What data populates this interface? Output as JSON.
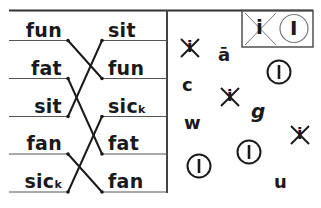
{
  "worksheet": {
    "colors": {
      "ink": "#1a1a1a",
      "rule": "#555555"
    },
    "matching": {
      "left_words": [
        {
          "text": "fun",
          "sub": ""
        },
        {
          "text": "fat",
          "sub": ""
        },
        {
          "text": "sit",
          "sub": ""
        },
        {
          "text": "fan",
          "sub": ""
        },
        {
          "text": "sic",
          "sub": "k"
        }
      ],
      "right_words": [
        {
          "text": "sit",
          "sub": ""
        },
        {
          "text": "fun",
          "sub": ""
        },
        {
          "text": "sic",
          "sub": "k"
        },
        {
          "text": "fat",
          "sub": ""
        },
        {
          "text": "fan",
          "sub": ""
        }
      ],
      "connections": [
        {
          "from_left": 0,
          "to_right": 1
        },
        {
          "from_left": 1,
          "to_right": 3
        },
        {
          "from_left": 2,
          "to_right": 0
        },
        {
          "from_left": 3,
          "to_right": 4
        },
        {
          "from_left": 4,
          "to_right": 2
        }
      ]
    },
    "legend": {
      "crossed_symbol": "i",
      "circled_symbol": "I"
    },
    "scatter_symbols": [
      {
        "type": "crossed",
        "glyph": "i",
        "x": 190,
        "y": 48
      },
      {
        "type": "letter",
        "glyph": "ā",
        "x": 224,
        "y": 56
      },
      {
        "type": "circled",
        "glyph": "I",
        "x": 279,
        "y": 72
      },
      {
        "type": "letter",
        "glyph": "c",
        "x": 188,
        "y": 86
      },
      {
        "type": "crossed",
        "glyph": "i",
        "x": 230,
        "y": 97
      },
      {
        "type": "letter",
        "glyph": "g",
        "x": 257,
        "y": 111
      },
      {
        "type": "letter",
        "glyph": "w",
        "x": 190,
        "y": 124
      },
      {
        "type": "crossed",
        "glyph": "i",
        "x": 300,
        "y": 135
      },
      {
        "type": "circled",
        "glyph": "I",
        "x": 249,
        "y": 152
      },
      {
        "type": "circled",
        "glyph": "I",
        "x": 199,
        "y": 166
      },
      {
        "type": "letter",
        "glyph": "u",
        "x": 280,
        "y": 183
      }
    ]
  }
}
